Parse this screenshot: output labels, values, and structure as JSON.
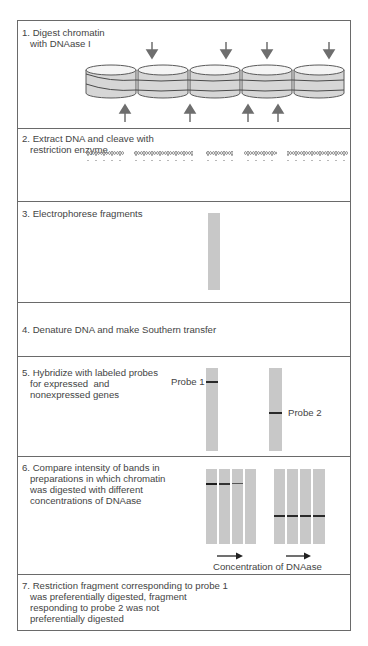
{
  "steps": [
    {
      "number": "1.",
      "text": "Digest chromatin\n   with DNAase I"
    },
    {
      "number": "2.",
      "text": "Extract DNA and cleave with\n   restriction enzyme"
    },
    {
      "number": "3.",
      "text": "Electrophorese fragments"
    },
    {
      "number": "4.",
      "text": "Denature DNA and make Southern transfer"
    },
    {
      "number": "5.",
      "text": "Hybridize with labeled probes\n   for expressed  and\n   nonexpressed genes"
    },
    {
      "number": "6.",
      "text": "Compare intensity of bands in\n   preparations in which chromatin\n   was digested with different\n   concentrations of DNAase"
    },
    {
      "number": "7.",
      "text": "Restriction fragment corresponding to probe 1\n   was preferentially digested, fragment\n   responding to probe 2 was not\n   preferentially digested"
    }
  ],
  "labels": {
    "probe1": "Probe 1",
    "probe2": "Probe 2",
    "concentration": "Concentration of DNAase"
  },
  "colors": {
    "lane": "#c8c8c8",
    "band": "#2a2a2a",
    "arrow": "#6e6e6e",
    "nucleosome_fill": "#d6d6d6",
    "border": "#6a6a6a"
  },
  "nucleosomes": {
    "count": 5
  },
  "arrows_top_x": [
    152,
    226,
    267,
    329
  ],
  "arrows_bottom_x": [
    125,
    190,
    248,
    278
  ],
  "dna_fragments": [
    {
      "x1": 86,
      "x2": 124
    },
    {
      "x1": 134,
      "x2": 193
    },
    {
      "x1": 206,
      "x2": 233
    },
    {
      "x1": 244,
      "x2": 277
    },
    {
      "x1": 287,
      "x2": 348
    }
  ],
  "gel_step6": {
    "probe1_band_widths_pct": [
      100,
      100,
      100,
      0
    ],
    "probe1_band_darkness": [
      1.0,
      0.8,
      0.5,
      0
    ],
    "probe2_band_present": [
      true,
      true,
      true,
      true
    ]
  }
}
